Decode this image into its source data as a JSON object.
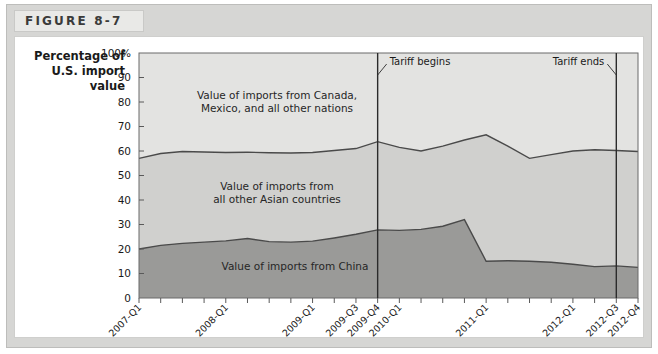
{
  "figure": {
    "label": "FIGURE 8-7"
  },
  "axis": {
    "y_title_line1": "Percentage of",
    "y_title_line2": "U.S. import",
    "y_title_line3": "value",
    "y_ticks": [
      "100%",
      "90",
      "80",
      "70",
      "60",
      "50",
      "40",
      "30",
      "20",
      "10",
      "0"
    ]
  },
  "labels": {
    "band_top_line1": "Value of imports from Canada,",
    "band_top_line2": "Mexico, and all other nations",
    "band_mid_line1": "Value of imports from",
    "band_mid_line2": "all other Asian countries",
    "band_bottom": "Value of imports from China",
    "tariff_begins": "Tariff begins",
    "tariff_ends": "Tariff ends"
  },
  "colors": {
    "band_top": "#e3e3e1",
    "band_mid": "#d0d0ce",
    "band_bottom": "#9a9a98",
    "line": "#4a4a4a",
    "frame": "#d6d6d4",
    "header_bg": "#e9e9e7"
  },
  "chart_data": {
    "type": "area",
    "title": "FIGURE 8-7",
    "xlabel": "",
    "ylabel": "Percentage of U.S. import value",
    "ylim": [
      0,
      100
    ],
    "grid": false,
    "legend": "inline-band-labels",
    "x_tick_labels": [
      {
        "index": 0,
        "label": "2007-Q1"
      },
      {
        "index": 4,
        "label": "2008-Q1"
      },
      {
        "index": 8,
        "label": "2009-Q1"
      },
      {
        "index": 10,
        "label": "2009-Q3"
      },
      {
        "index": 11,
        "label": "2009-Q4"
      },
      {
        "index": 12,
        "label": "2010-Q1"
      },
      {
        "index": 16,
        "label": "2011-Q1"
      },
      {
        "index": 20,
        "label": "2012-Q1"
      },
      {
        "index": 22,
        "label": "2012-Q3"
      },
      {
        "index": 23,
        "label": "2012-Q4"
      }
    ],
    "x": [
      "2007-Q1",
      "2007-Q2",
      "2007-Q3",
      "2007-Q4",
      "2008-Q1",
      "2008-Q2",
      "2008-Q3",
      "2008-Q4",
      "2009-Q1",
      "2009-Q2",
      "2009-Q3",
      "2009-Q4",
      "2010-Q1",
      "2010-Q2",
      "2010-Q3",
      "2010-Q4",
      "2011-Q1",
      "2011-Q2",
      "2011-Q3",
      "2011-Q4",
      "2012-Q1",
      "2012-Q2",
      "2012-Q3",
      "2012-Q4"
    ],
    "series": [
      {
        "name": "Value of imports from China",
        "stack_cumulative": [
          20.0,
          21.5,
          22.3,
          22.8,
          23.3,
          24.3,
          23.0,
          22.8,
          23.2,
          24.5,
          26.0,
          27.8,
          27.6,
          28.0,
          29.3,
          32.0,
          15.0,
          15.2,
          15.0,
          14.6,
          13.8,
          12.8,
          13.1,
          12.5
        ],
        "color": "#9a9a98"
      },
      {
        "name": "Value of imports from all other Asian countries",
        "stack_cumulative": [
          57.0,
          59.0,
          59.8,
          59.6,
          59.4,
          59.5,
          59.3,
          59.2,
          59.4,
          60.2,
          61.0,
          63.8,
          61.5,
          60.0,
          62.0,
          64.5,
          66.6,
          62.0,
          57.0,
          58.5,
          60.0,
          60.5,
          60.2,
          59.8
        ],
        "color": "#d0d0ce"
      }
    ],
    "china_values_full": [
      20.0,
      21.5,
      22.3,
      22.8,
      23.3,
      24.3,
      23.0,
      22.8,
      23.2,
      24.5,
      26.0,
      27.8,
      27.6,
      28.0,
      29.3,
      32.0,
      15.0,
      15.2,
      15.0,
      14.6,
      13.8,
      12.8,
      13.1,
      12.5,
      13.0,
      13.8,
      14.5,
      13.2,
      12.6,
      13.0,
      14.2,
      22.0
    ],
    "annotations": [
      {
        "text": "Tariff begins",
        "x_label": "2009-Q4",
        "type": "vertical-line"
      },
      {
        "text": "Tariff ends",
        "x_label": "2012-Q3",
        "type": "vertical-line"
      }
    ]
  }
}
